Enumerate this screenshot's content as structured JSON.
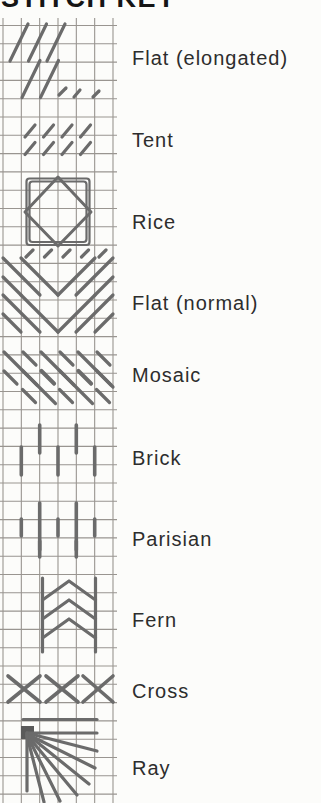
{
  "title": "STITCH KEY",
  "colors": {
    "background": "#fcfcfa",
    "grid_line": "#999590",
    "stitch": "#6b6b6b",
    "stitch_dark": "#5a5a5a",
    "title_text": "#151515",
    "label_text": "#2d2d2d"
  },
  "grid": {
    "x_start": 3,
    "x_step": 18.333,
    "x_count": 7,
    "y_start": 25.5,
    "y_step": 18.3,
    "y_count": 43,
    "top": 18,
    "bottom": 803,
    "left": 0,
    "right": 117,
    "stroke_width": 1.1
  },
  "labels": [
    {
      "id": "flat-elongated",
      "label": "Flat (elongated)"
    },
    {
      "id": "tent",
      "label": "Tent"
    },
    {
      "id": "rice",
      "label": "Rice"
    },
    {
      "id": "flat-normal",
      "label": "Flat (normal)"
    },
    {
      "id": "mosaic",
      "label": "Mosaic"
    },
    {
      "id": "brick",
      "label": "Brick"
    },
    {
      "id": "parisian",
      "label": "Parisian"
    },
    {
      "id": "fern",
      "label": "Fern"
    },
    {
      "id": "cross",
      "label": "Cross"
    },
    {
      "id": "ray",
      "label": "Ray"
    }
  ],
  "patterns": [
    {
      "name": "flat-elongated",
      "strokes": [
        {
          "t": "l",
          "p": [
            10,
            61,
            28,
            24
          ]
        },
        {
          "t": "l",
          "p": [
            28.5,
            61,
            46.5,
            24
          ]
        },
        {
          "t": "l",
          "p": [
            47,
            61,
            65,
            24
          ]
        },
        {
          "t": "l",
          "p": [
            22,
            97.5,
            40,
            60.5
          ]
        },
        {
          "t": "l",
          "p": [
            40.5,
            97.5,
            58.5,
            60.5
          ]
        },
        {
          "t": "l",
          "p": [
            59,
            95,
            66,
            88
          ]
        },
        {
          "t": "l",
          "p": [
            74,
            97,
            80,
            90
          ]
        },
        {
          "t": "l",
          "p": [
            93,
            97,
            99,
            91
          ]
        }
      ]
    },
    {
      "name": "tent",
      "strokes": [
        {
          "t": "l",
          "p": [
            25,
            137,
            35,
            125
          ]
        },
        {
          "t": "l",
          "p": [
            43.5,
            137,
            53.5,
            125
          ]
        },
        {
          "t": "l",
          "p": [
            62,
            137,
            72,
            125
          ]
        },
        {
          "t": "l",
          "p": [
            80.5,
            137,
            90.5,
            125
          ]
        },
        {
          "t": "l",
          "p": [
            25,
            154.5,
            35,
            142.5
          ]
        },
        {
          "t": "l",
          "p": [
            43.5,
            154.5,
            53.5,
            142.5
          ]
        },
        {
          "t": "l",
          "p": [
            62,
            154.5,
            72,
            142.5
          ]
        },
        {
          "t": "l",
          "p": [
            80.5,
            154.5,
            90.5,
            142.5
          ]
        }
      ]
    },
    {
      "name": "rice",
      "strokes": [
        {
          "t": "r",
          "p": [
            26.5,
            178.5,
            63,
            66.5
          ],
          "w": 2.2
        },
        {
          "t": "r",
          "p": [
            29.5,
            181.5,
            57,
            60.5
          ],
          "w": 2.2
        },
        {
          "t": "pg",
          "p": [
            [
              58,
              177
            ],
            [
              91,
              212
            ],
            [
              58,
              246
            ],
            [
              25,
              212
            ]
          ],
          "w": 3
        }
      ]
    },
    {
      "name": "flat-normal",
      "strokes": [
        {
          "t": "l",
          "p": [
            26,
            257,
            33,
            250
          ]
        },
        {
          "t": "l",
          "p": [
            44.5,
            257,
            51.5,
            250
          ]
        },
        {
          "t": "l",
          "p": [
            63,
            257,
            70,
            250
          ]
        },
        {
          "t": "l",
          "p": [
            81.5,
            257,
            88.5,
            250
          ]
        },
        {
          "t": "l",
          "p": [
            99,
            257,
            106,
            250
          ]
        },
        {
          "t": "l",
          "p": [
            3,
            277,
            21,
            295
          ]
        },
        {
          "t": "l",
          "p": [
            3,
            258,
            40,
            295
          ]
        },
        {
          "t": "l",
          "p": [
            21,
            258,
            58,
            295
          ]
        },
        {
          "t": "l",
          "p": [
            58,
            295,
            95,
            258
          ]
        },
        {
          "t": "l",
          "p": [
            76,
            295,
            113,
            258
          ]
        },
        {
          "t": "l",
          "p": [
            95,
            295,
            113,
            277
          ]
        },
        {
          "t": "l",
          "p": [
            3,
            314,
            21,
            332
          ]
        },
        {
          "t": "l",
          "p": [
            3,
            295,
            40,
            332
          ]
        },
        {
          "t": "l",
          "p": [
            21,
            295,
            58,
            332
          ]
        },
        {
          "t": "l",
          "p": [
            58,
            332,
            95,
            295
          ]
        },
        {
          "t": "l",
          "p": [
            76,
            332,
            113,
            295
          ]
        },
        {
          "t": "l",
          "p": [
            95,
            332,
            113,
            314
          ]
        }
      ]
    },
    {
      "name": "mosaic",
      "strokes": [
        {
          "t": "l",
          "p": [
            4,
            352,
            37,
            385
          ]
        },
        {
          "t": "l",
          "p": [
            23,
            352,
            36,
            365
          ]
        },
        {
          "t": "l",
          "p": [
            4,
            371,
            17,
            384
          ]
        },
        {
          "t": "l",
          "p": [
            41,
            352,
            74,
            385
          ]
        },
        {
          "t": "l",
          "p": [
            60,
            352,
            73,
            365
          ]
        },
        {
          "t": "l",
          "p": [
            41,
            371,
            54,
            384
          ]
        },
        {
          "t": "l",
          "p": [
            78,
            352,
            111,
            385
          ]
        },
        {
          "t": "l",
          "p": [
            97,
            352,
            110,
            365
          ]
        },
        {
          "t": "l",
          "p": [
            78,
            371,
            91,
            384
          ]
        },
        {
          "t": "l",
          "p": [
            22.5,
            370.5,
            55.5,
            403.5
          ]
        },
        {
          "t": "l",
          "p": [
            41.5,
            370.5,
            54.5,
            383.5
          ]
        },
        {
          "t": "l",
          "p": [
            22.5,
            389.5,
            35.5,
            402.5
          ]
        },
        {
          "t": "l",
          "p": [
            59.5,
            370.5,
            92.5,
            403.5
          ]
        },
        {
          "t": "l",
          "p": [
            78.5,
            370.5,
            91.5,
            383.5
          ]
        },
        {
          "t": "l",
          "p": [
            59.5,
            389.5,
            72.5,
            402.5
          ]
        },
        {
          "t": "l",
          "p": [
            96.5,
            370.5,
            113,
            387
          ]
        },
        {
          "t": "l",
          "p": [
            96.5,
            389.5,
            109.5,
            402.5
          ]
        }
      ]
    },
    {
      "name": "brick",
      "strokes": [
        {
          "t": "l",
          "p": [
            39.7,
            425,
            39.7,
            453
          ],
          "w": 3.6
        },
        {
          "t": "l",
          "p": [
            76.3,
            425,
            76.3,
            453
          ],
          "w": 3.6
        },
        {
          "t": "l",
          "p": [
            21.3,
            447,
            21.3,
            475
          ],
          "w": 3.6
        },
        {
          "t": "l",
          "p": [
            58,
            447,
            58,
            475
          ],
          "w": 3.6
        },
        {
          "t": "l",
          "p": [
            94.7,
            447,
            94.7,
            475
          ],
          "w": 3.6
        }
      ]
    },
    {
      "name": "parisian",
      "strokes": [
        {
          "t": "l",
          "p": [
            39.7,
            503,
            39.7,
            550
          ],
          "w": 3.6
        },
        {
          "t": "l",
          "p": [
            76.3,
            503,
            76.3,
            550
          ],
          "w": 3.6
        },
        {
          "t": "l",
          "p": [
            21.3,
            519,
            21.3,
            536
          ],
          "w": 3.6
        },
        {
          "t": "l",
          "p": [
            58,
            519,
            58,
            536
          ],
          "w": 3.6
        },
        {
          "t": "l",
          "p": [
            94.7,
            519,
            94.7,
            536
          ],
          "w": 3.6
        },
        {
          "t": "l",
          "p": [
            39.7,
            541,
            39.7,
            557
          ],
          "w": 3.6
        },
        {
          "t": "l",
          "p": [
            76.3,
            541,
            76.3,
            557
          ],
          "w": 3.6
        }
      ]
    },
    {
      "name": "fern",
      "strokes": [
        {
          "t": "l",
          "p": [
            42.5,
            578,
            42.5,
            652
          ]
        },
        {
          "t": "l",
          "p": [
            95.5,
            578,
            95.5,
            652
          ]
        },
        {
          "t": "pl",
          "p": [
            [
              42.5,
              600
            ],
            [
              69,
              581
            ],
            [
              95.5,
              600
            ]
          ]
        },
        {
          "t": "pl",
          "p": [
            [
              42.5,
              619
            ],
            [
              69,
              600
            ],
            [
              95.5,
              619
            ]
          ]
        },
        {
          "t": "pl",
          "p": [
            [
              42.5,
              638
            ],
            [
              69,
              619
            ],
            [
              95.5,
              638
            ]
          ]
        }
      ]
    },
    {
      "name": "cross",
      "strokes": [
        {
          "t": "l",
          "p": [
            8,
            676,
            40,
            702
          ],
          "w": 3.6
        },
        {
          "t": "l",
          "p": [
            8,
            702,
            40,
            676
          ],
          "w": 3.6
        },
        {
          "t": "l",
          "p": [
            46,
            676,
            78,
            702
          ],
          "w": 3.6
        },
        {
          "t": "l",
          "p": [
            46,
            702,
            78,
            676
          ],
          "w": 3.6
        },
        {
          "t": "l",
          "p": [
            83,
            676,
            113,
            702
          ],
          "w": 3.6
        },
        {
          "t": "l",
          "p": [
            83,
            702,
            113,
            676
          ],
          "w": 3.6
        }
      ]
    },
    {
      "name": "ray",
      "strokes": [
        {
          "t": "fr",
          "p": [
            21,
            726,
            13,
            13
          ]
        },
        {
          "t": "l",
          "p": [
            23,
            719.5,
            97,
            719.5
          ]
        },
        {
          "t": "l",
          "p": [
            27,
            733,
            97,
            733
          ]
        },
        {
          "t": "l",
          "p": [
            27,
            733,
            97,
            751
          ]
        },
        {
          "t": "l",
          "p": [
            27,
            734,
            95,
            768
          ]
        },
        {
          "t": "l",
          "p": [
            27,
            734,
            89,
            784
          ]
        },
        {
          "t": "l",
          "p": [
            27,
            735,
            77,
            795
          ]
        },
        {
          "t": "l",
          "p": [
            27,
            735,
            60,
            801
          ]
        },
        {
          "t": "l",
          "p": [
            27,
            736,
            44,
            802
          ]
        },
        {
          "t": "l",
          "p": [
            27,
            736,
            27,
            791
          ]
        }
      ]
    }
  ]
}
